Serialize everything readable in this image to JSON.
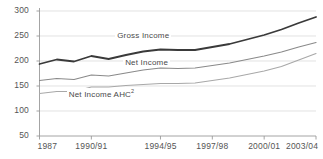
{
  "chart_data": {
    "type": "line",
    "title": "",
    "subtitle": "",
    "xlabel": "",
    "ylabel": "",
    "ylim": [
      50,
      300
    ],
    "yticks": [
      50,
      100,
      150,
      200,
      250,
      300
    ],
    "grid": true,
    "legend_position": "inline-labels",
    "x": [
      "1987",
      "1988/89",
      "1989/90",
      "1990/91",
      "1991/92",
      "1992/93",
      "1993/94",
      "1994/95",
      "1995/96",
      "1996/97",
      "1997/98",
      "1998/99",
      "1999/00",
      "2000/01",
      "2001/02",
      "2002/03",
      "2003/04"
    ],
    "xticks": [
      "1987",
      "1990/91",
      "1994/95",
      "1997/98",
      "2000/01",
      "2003/04"
    ],
    "xtick_indices": [
      0,
      3,
      7,
      10,
      13,
      16
    ],
    "series": [
      {
        "name": "Gross Income",
        "color": "#3a3a3a",
        "width": 1.8,
        "values": [
          194,
          203,
          199,
          210,
          204,
          212,
          219,
          223,
          222,
          222,
          228,
          234,
          243,
          252,
          263,
          276,
          288
        ]
      },
      {
        "name": "Net Income",
        "color": "#8a8a8a",
        "width": 1.2,
        "values": [
          161,
          165,
          163,
          172,
          170,
          176,
          182,
          186,
          185,
          186,
          191,
          196,
          203,
          210,
          218,
          228,
          237
        ]
      },
      {
        "name": "Net Income AHC",
        "color": "#a8a8a8",
        "width": 1.1,
        "superscript": "2",
        "values": [
          135,
          139,
          139,
          148,
          148,
          151,
          153,
          155,
          155,
          156,
          161,
          166,
          173,
          180,
          189,
          202,
          215
        ]
      }
    ],
    "annotations": [
      {
        "text": "Gross Income",
        "x_index": 6.0,
        "y": 250
      },
      {
        "text": "Net Income",
        "x_index": 6.2,
        "y": 196
      },
      {
        "text": "Net Income AHC",
        "x_index": 3.6,
        "y": 137
      }
    ],
    "axis_color": "#9a9a9a",
    "grid_color": "#d6d6d6",
    "tick_label_color": "#555555"
  }
}
